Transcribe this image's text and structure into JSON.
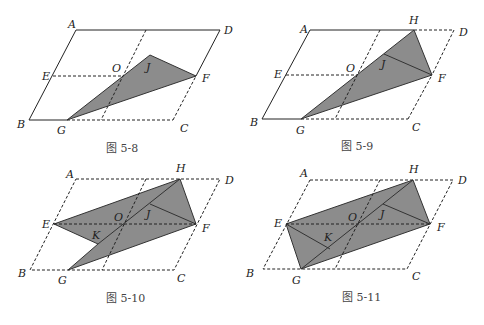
{
  "colors": {
    "shade": "#8c8c8c",
    "line": "#222222",
    "background": "#ffffff"
  },
  "figures": [
    {
      "caption": "图 5-8",
      "labels": {
        "A": "A",
        "D": "D",
        "E": "E",
        "O": "O",
        "J": "J",
        "F": "F",
        "B": "B",
        "G": "G",
        "C": "C"
      }
    },
    {
      "caption": "图 5-9",
      "labels": {
        "A": "A",
        "H": "H",
        "D": "D",
        "E": "E",
        "O": "O",
        "J": "J",
        "F": "F",
        "B": "B",
        "G": "G",
        "C": "C"
      }
    },
    {
      "caption": "图 5-10",
      "labels": {
        "A": "A",
        "H": "H",
        "D": "D",
        "E": "E",
        "O": "O",
        "J": "J",
        "K": "K",
        "F": "F",
        "B": "B",
        "G": "G",
        "C": "C"
      }
    },
    {
      "caption": "图 5-11",
      "labels": {
        "A": "A",
        "H": "H",
        "D": "D",
        "E": "E",
        "O": "O",
        "J": "J",
        "K": "K",
        "F": "F",
        "B": "B",
        "G": "G",
        "C": "C"
      }
    }
  ]
}
